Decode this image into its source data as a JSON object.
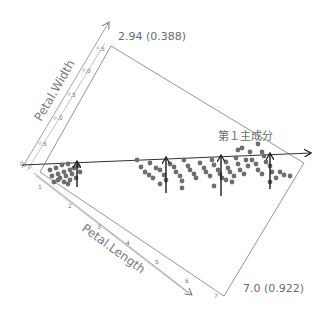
{
  "chart_data": {
    "type": "scatter",
    "title": "",
    "axes": [
      {
        "name": "Petal.Length",
        "label": "Petal.Length",
        "ticks": [
          "1",
          "2",
          "3",
          "4",
          "5",
          "6",
          "7"
        ],
        "range": [
          1,
          7
        ]
      },
      {
        "name": "Petal.Width",
        "label": "Petal.Width",
        "ticks": [
          "0.5",
          "1.0",
          "1.5",
          "2.0",
          "2.5"
        ],
        "range": [
          0,
          2.5
        ]
      }
    ],
    "principal_component": {
      "label": "第１主成分",
      "loading_labels": {
        "petal_length": "7.0 (0.922)",
        "petal_width": "2.94 (0.388)"
      }
    },
    "series": [
      {
        "name": "setosa-cluster",
        "points_px": [
          [
            50,
            170
          ],
          [
            56,
            168
          ],
          [
            62,
            165
          ],
          [
            68,
            164
          ],
          [
            52,
            176
          ],
          [
            58,
            174
          ],
          [
            64,
            172
          ],
          [
            70,
            170
          ],
          [
            60,
            178
          ],
          [
            66,
            176
          ],
          [
            72,
            174
          ],
          [
            74,
            168
          ],
          [
            78,
            166
          ],
          [
            80,
            172
          ],
          [
            70,
            180
          ],
          [
            76,
            178
          ],
          [
            64,
            182
          ],
          [
            58,
            180
          ],
          [
            54,
            182
          ],
          [
            68,
            184
          ]
        ]
      },
      {
        "name": "versicolor-virginica-cluster",
        "points_px": [
          [
            137,
            160
          ],
          [
            141,
            167
          ],
          [
            145,
            172
          ],
          [
            149,
            175
          ],
          [
            153,
            178
          ],
          [
            150,
            163
          ],
          [
            156,
            168
          ],
          [
            160,
            170
          ],
          [
            164,
            175
          ],
          [
            166,
            180
          ],
          [
            170,
            164
          ],
          [
            174,
            167
          ],
          [
            176,
            172
          ],
          [
            180,
            176
          ],
          [
            182,
            181
          ],
          [
            184,
            160
          ],
          [
            188,
            166
          ],
          [
            190,
            170
          ],
          [
            194,
            174
          ],
          [
            196,
            178
          ],
          [
            200,
            163
          ],
          [
            204,
            168
          ],
          [
            206,
            172
          ],
          [
            210,
            176
          ],
          [
            212,
            160
          ],
          [
            214,
            165
          ],
          [
            218,
            170
          ],
          [
            220,
            174
          ],
          [
            222,
            178
          ],
          [
            226,
            162
          ],
          [
            228,
            168
          ],
          [
            230,
            172
          ],
          [
            234,
            176
          ],
          [
            236,
            158
          ],
          [
            238,
            164
          ],
          [
            240,
            170
          ],
          [
            244,
            174
          ],
          [
            246,
            160
          ],
          [
            248,
            166
          ],
          [
            250,
            152
          ],
          [
            252,
            160
          ],
          [
            256,
            164
          ],
          [
            258,
            170
          ],
          [
            262,
            174
          ],
          [
            264,
            156
          ],
          [
            266,
            162
          ],
          [
            270,
            166
          ],
          [
            272,
            172
          ],
          [
            276,
            178
          ],
          [
            280,
            172
          ],
          [
            284,
            175
          ],
          [
            290,
            176
          ],
          [
            238,
            150
          ],
          [
            242,
            148
          ],
          [
            258,
            144
          ],
          [
            262,
            152
          ],
          [
            226,
            180
          ],
          [
            232,
            182
          ],
          [
            214,
            186
          ],
          [
            182,
            188
          ],
          [
            160,
            184
          ],
          [
            270,
            182
          ]
        ]
      }
    ],
    "projection_arrows_px": [
      {
        "from": [
          77,
          187
        ],
        "to": [
          77,
          161
        ]
      },
      {
        "from": [
          166,
          193
        ],
        "to": [
          166,
          157
        ]
      },
      {
        "from": [
          221,
          196
        ],
        "to": [
          221,
          155
        ]
      },
      {
        "from": [
          270,
          189
        ],
        "to": [
          270,
          153
        ]
      }
    ]
  }
}
